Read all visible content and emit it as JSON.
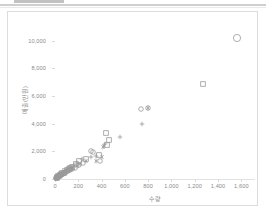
{
  "window": {
    "top_tab_label": "",
    "divider": true
  },
  "chart_data": {
    "type": "scatter",
    "title": "",
    "xlabel": "수량",
    "ylabel": "매출(만원)",
    "xlim": [
      0,
      1700
    ],
    "ylim": [
      0,
      11000
    ],
    "grid": false,
    "legend": "none",
    "xticks": [
      0,
      200,
      400,
      600,
      800,
      1000,
      1200,
      1400,
      1600
    ],
    "xtick_labels": [
      "0",
      "200",
      "400",
      "600",
      "800",
      "1,000",
      "1,200",
      "1,400",
      "1,600"
    ],
    "yticks": [
      0,
      2000,
      4000,
      6000,
      8000,
      10000
    ],
    "ytick_labels": [
      "0",
      "2,000",
      "4,000",
      "6,000",
      "8,000",
      "10,000"
    ],
    "marker_color": "#9a9a9a",
    "series": [
      {
        "name": "series-circle",
        "marker": "circle",
        "points": [
          [
            1560,
            10200
          ],
          [
            735,
            5100
          ],
          [
            800,
            5150
          ],
          [
            305,
            2020
          ],
          [
            330,
            1960
          ],
          [
            390,
            1300
          ],
          [
            240,
            1180
          ],
          [
            205,
            980
          ],
          [
            172,
            760
          ],
          [
            150,
            700
          ],
          [
            128,
            630
          ],
          [
            110,
            560
          ],
          [
            96,
            500
          ],
          [
            84,
            440
          ],
          [
            72,
            390
          ],
          [
            62,
            340
          ],
          [
            52,
            300
          ],
          [
            44,
            255
          ],
          [
            36,
            215
          ],
          [
            28,
            175
          ],
          [
            22,
            140
          ],
          [
            16,
            105
          ],
          [
            11,
            75
          ],
          [
            7,
            48
          ]
        ]
      },
      {
        "name": "series-square",
        "marker": "square",
        "points": [
          [
            1270,
            6900
          ],
          [
            440,
            3300
          ],
          [
            465,
            2820
          ],
          [
            450,
            2480
          ],
          [
            380,
            1740
          ],
          [
            270,
            1460
          ],
          [
            205,
            1290
          ],
          [
            178,
            1055
          ],
          [
            150,
            900
          ],
          [
            132,
            800
          ],
          [
            116,
            700
          ],
          [
            100,
            620
          ],
          [
            88,
            545
          ],
          [
            76,
            470
          ],
          [
            64,
            405
          ],
          [
            54,
            345
          ],
          [
            45,
            290
          ],
          [
            37,
            240
          ],
          [
            29,
            195
          ],
          [
            21,
            150
          ],
          [
            14,
            105
          ]
        ]
      },
      {
        "name": "series-plus",
        "marker": "plus",
        "points": [
          [
            745,
            4000
          ],
          [
            560,
            3050
          ],
          [
            430,
            2560
          ],
          [
            350,
            1700
          ],
          [
            305,
            1560
          ],
          [
            230,
            1430
          ],
          [
            190,
            1150
          ],
          [
            162,
            980
          ],
          [
            140,
            860
          ],
          [
            120,
            760
          ],
          [
            104,
            670
          ],
          [
            90,
            590
          ],
          [
            78,
            515
          ],
          [
            66,
            450
          ],
          [
            56,
            385
          ],
          [
            46,
            325
          ],
          [
            38,
            270
          ],
          [
            30,
            220
          ],
          [
            23,
            175
          ],
          [
            17,
            130
          ],
          [
            10,
            85
          ]
        ]
      },
      {
        "name": "series-asterisk",
        "marker": "asterisk",
        "points": [
          [
            800,
            5150
          ],
          [
            420,
            2380
          ],
          [
            410,
            2290
          ],
          [
            400,
            1620
          ],
          [
            355,
            1330
          ],
          [
            265,
            1270
          ],
          [
            215,
            1090
          ],
          [
            185,
            930
          ],
          [
            158,
            820
          ],
          [
            136,
            720
          ],
          [
            118,
            640
          ],
          [
            102,
            560
          ],
          [
            88,
            490
          ],
          [
            74,
            425
          ],
          [
            62,
            365
          ],
          [
            50,
            310
          ],
          [
            40,
            255
          ],
          [
            32,
            205
          ],
          [
            25,
            160
          ],
          [
            18,
            120
          ],
          [
            12,
            80
          ],
          [
            6,
            45
          ]
        ]
      }
    ]
  }
}
